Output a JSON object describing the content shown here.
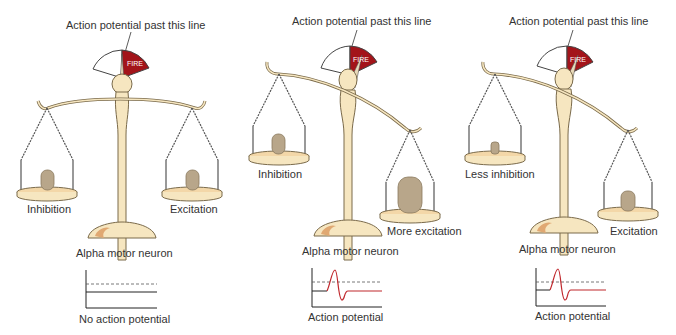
{
  "colors": {
    "fire_red": "#a3141a",
    "wood": "#f6e6c0",
    "wood_outline": "#7a6a4a",
    "pan": "#f3d7a8",
    "weight": "#b8a68a",
    "trace_red": "#c0282d",
    "axis": "#222222"
  },
  "panels": [
    {
      "id": "balanced",
      "threshold_label": "Action potential past this line",
      "gauge_label": "FIRE",
      "left_label": "Inhibition",
      "right_label": "Excitation",
      "neuron_label": "Alpha motor neuron",
      "result_label": "No action potential",
      "tilt": "level"
    },
    {
      "id": "more-excitation",
      "threshold_label": "Action potential past this line",
      "gauge_label": "FIRE",
      "left_label": "Inhibition",
      "right_label": "More excitation",
      "neuron_label": "Alpha motor neuron",
      "result_label": "Action potential",
      "tilt": "right-down"
    },
    {
      "id": "less-inhibition",
      "threshold_label": "Action potential past this line",
      "gauge_label": "FIRE",
      "left_label": "Less inhibition",
      "right_label": "Excitation",
      "neuron_label": "Alpha motor neuron",
      "result_label": "Action potential",
      "tilt": "right-down"
    }
  ]
}
